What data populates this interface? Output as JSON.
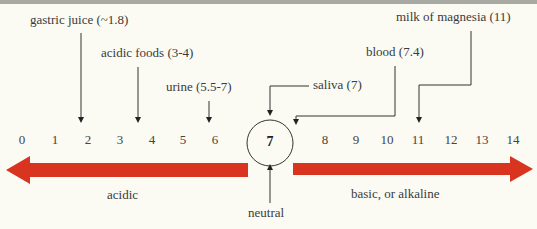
{
  "diagram": {
    "scale": {
      "ticks": [
        "0",
        "1",
        "2",
        "3",
        "4",
        "5",
        "6",
        "7",
        "8",
        "9",
        "10",
        "11",
        "12",
        "13",
        "14"
      ],
      "neutral_value": "7"
    },
    "substances": [
      {
        "label": "gastric juice (~1.8)",
        "name": "gastric juice",
        "ph": "~1.8"
      },
      {
        "label": "acidic foods (3-4)",
        "name": "acidic foods",
        "ph": "3-4"
      },
      {
        "label": "urine (5.5-7)",
        "name": "urine",
        "ph": "5.5-7"
      },
      {
        "label": "saliva (7)",
        "name": "saliva",
        "ph": "7"
      },
      {
        "label": "blood (7.4)",
        "name": "blood",
        "ph": "7.4"
      },
      {
        "label": "milk of magnesia (11)",
        "name": "milk of magnesia",
        "ph": "11"
      }
    ],
    "arrows": {
      "left_label": "acidic",
      "right_label": "basic, or alkaline",
      "neutral_label": "neutral",
      "color": "#d9341f"
    }
  }
}
